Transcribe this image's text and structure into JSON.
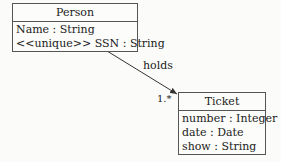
{
  "classes": {
    "person": {
      "name": "Person",
      "attributes": [
        "Name : String",
        "<<unique>> SSN : String"
      ]
    },
    "ticket": {
      "name": "Ticket",
      "attributes": [
        "number : Integer",
        "date : Date",
        "show : String"
      ]
    }
  },
  "association": {
    "label": "holds",
    "target_multiplicity": "1.*",
    "from": "Person",
    "to": "Ticket",
    "navigable_to": "Ticket"
  }
}
